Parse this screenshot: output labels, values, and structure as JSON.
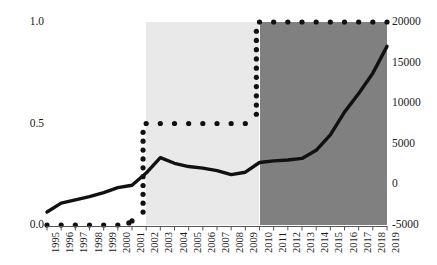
{
  "chart_data": {
    "type": "line",
    "title": "",
    "subtitle": "",
    "xlabel": "",
    "ylabel": "",
    "grid": false,
    "legend_position": "none",
    "x": [
      1995,
      1996,
      1997,
      1998,
      1999,
      2000,
      2001,
      2002,
      2003,
      2004,
      2005,
      2006,
      2007,
      2008,
      2009,
      2010,
      2011,
      2012,
      2013,
      2014,
      2015,
      2016,
      2017,
      2018,
      2019
    ],
    "x_tick_labels": [
      "1995",
      "1996",
      "1997",
      "1998",
      "1999",
      "2000",
      "2001",
      "2002",
      "2003",
      "2004",
      "2005",
      "2006",
      "2007",
      "2008",
      "2009",
      "2010",
      "2011",
      "2012",
      "2013",
      "2014",
      "2015",
      "2016",
      "2017",
      "2018",
      "2019"
    ],
    "axes": {
      "left": {
        "ylim": [
          0.0,
          1.0
        ],
        "tick_values": [
          0.0,
          0.5,
          1.0
        ],
        "tick_labels": [
          "0.0",
          "0.5",
          "1.0"
        ]
      },
      "right": {
        "ylim": [
          -5000,
          20000
        ],
        "tick_values": [
          -5000,
          0,
          5000,
          10000,
          15000,
          20000
        ],
        "tick_labels": [
          "-5000",
          "0",
          "5000",
          "10000",
          "15000",
          "20000"
        ]
      }
    },
    "series": [
      {
        "name": "solid-line-series",
        "style": "solid",
        "axis": "right",
        "color": "#111111",
        "values": [
          -3400,
          -2300,
          -1900,
          -1500,
          -1000,
          -400,
          -100,
          1400,
          3300,
          2600,
          2200,
          2000,
          1700,
          1200,
          1500,
          2700,
          2900,
          3000,
          3200,
          4200,
          6100,
          8900,
          11200,
          13700,
          17000
        ]
      },
      {
        "name": "dotted-step-series",
        "style": "dotted",
        "axis": "left",
        "color": "#111111",
        "values": [
          0.0,
          0.0,
          0.0,
          0.0,
          0.0,
          0.0,
          0.02,
          0.5,
          0.5,
          0.5,
          0.5,
          0.5,
          0.5,
          0.5,
          0.5,
          1.0,
          1.0,
          1.0,
          1.0,
          1.0,
          1.0,
          1.0,
          1.0,
          1.0,
          1.0
        ]
      }
    ],
    "shaded_regions": [
      {
        "name": "light-band",
        "x_start": 2002,
        "x_end": 2010,
        "color": "#e9e9e9"
      },
      {
        "name": "dark-band",
        "x_start": 2010,
        "x_end": 2019,
        "color": "#808080"
      }
    ]
  }
}
